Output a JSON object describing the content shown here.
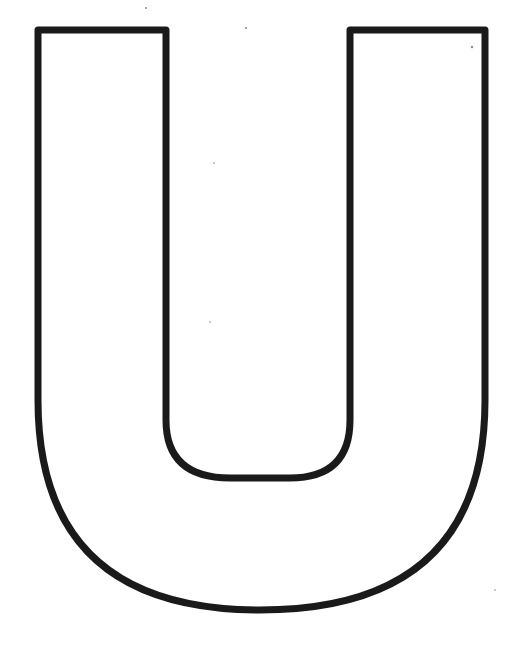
{
  "image": {
    "subject": "Letter U outline",
    "letter": "U",
    "background_color": "#ffffff",
    "stroke_color": "#1a1a1a"
  }
}
